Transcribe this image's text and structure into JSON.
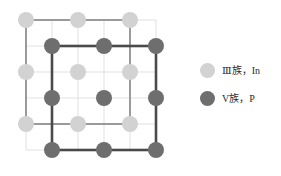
{
  "figure": {
    "background_color": "#ffffff"
  },
  "chart_data": {
    "type": "scatter",
    "title": "",
    "xlabel": "",
    "ylabel": "",
    "grid": true,
    "legend_position": "right",
    "xlim": [
      0,
      182
    ],
    "ylim": [
      0,
      176
    ],
    "grid_spec": {
      "color": "#d9d9d9",
      "line_width": 0.8,
      "x_lines": [
        26,
        52,
        78,
        104,
        130,
        156
      ],
      "y_lines": [
        20,
        46,
        72,
        98,
        124,
        150
      ]
    },
    "series": [
      {
        "name": "Ⅲ族，In",
        "element": "In",
        "group": "Ⅲ族",
        "color": "#d2d2d2",
        "marker": "circle",
        "marker_size": 16,
        "points": [
          [
            26,
            20
          ],
          [
            78,
            20
          ],
          [
            130,
            20
          ],
          [
            26,
            72
          ],
          [
            78,
            72
          ],
          [
            130,
            72
          ],
          [
            26,
            124
          ],
          [
            78,
            124
          ],
          [
            130,
            124
          ]
        ]
      },
      {
        "name": "V族，P",
        "element": "P",
        "group": "V族",
        "color": "#6e6e6e",
        "marker": "circle",
        "marker_size": 16,
        "points": [
          [
            52,
            46
          ],
          [
            104,
            46
          ],
          [
            156,
            46
          ],
          [
            52,
            98
          ],
          [
            104,
            98
          ],
          [
            156,
            98
          ],
          [
            52,
            150
          ],
          [
            104,
            150
          ],
          [
            156,
            150
          ]
        ]
      }
    ],
    "annotations": [
      {
        "name": "in-unit-cell",
        "type": "rect",
        "x": 26,
        "y": 20,
        "width": 104,
        "height": 104,
        "stroke": "#9a9a9a",
        "stroke_width": 2,
        "fill": "none"
      },
      {
        "name": "p-unit-cell",
        "type": "rect",
        "x": 52,
        "y": 46,
        "width": 104,
        "height": 104,
        "stroke": "#4a4a4a",
        "stroke_width": 2.6,
        "fill": "none"
      }
    ]
  },
  "legend": {
    "items": [
      {
        "id": "legend-in",
        "swatch": "light",
        "color": "#d2d2d2",
        "label": "Ⅲ族，In"
      },
      {
        "id": "legend-p",
        "swatch": "dark",
        "color": "#6e6e6e",
        "label": "V族，P"
      }
    ]
  }
}
